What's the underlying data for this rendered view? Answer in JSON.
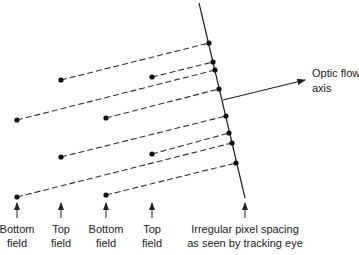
{
  "diagram": {
    "annotations": {
      "optic_flow_line1": "Optic flow",
      "optic_flow_line2": "axis",
      "spacing_line1": "Irregular pixel spacing",
      "spacing_line2": "as seen by tracking eye"
    },
    "field_labels": [
      {
        "line1": "Bottom",
        "line2": "field"
      },
      {
        "line1": "Top",
        "line2": "field"
      },
      {
        "line1": "Bottom",
        "line2": "field"
      },
      {
        "line1": "Top",
        "line2": "field"
      }
    ],
    "colors": {
      "ink": "#222222",
      "background": "#ffffff"
    }
  }
}
